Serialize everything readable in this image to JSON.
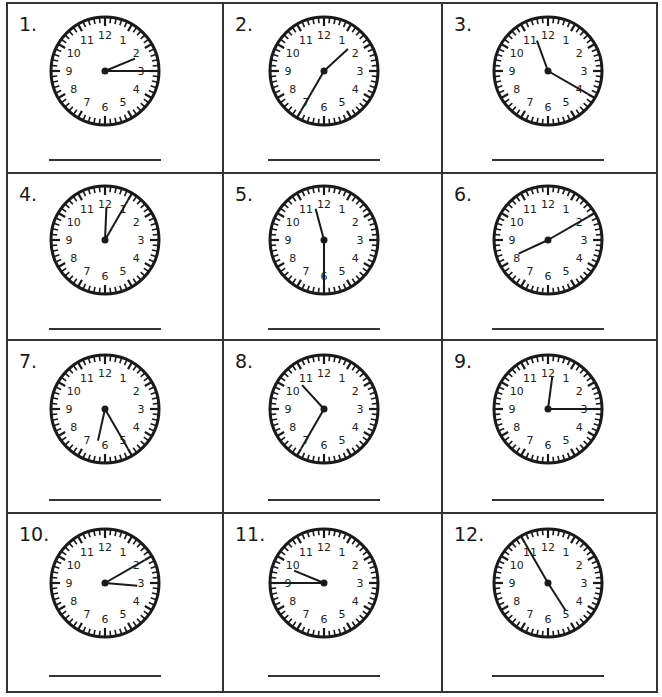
{
  "worksheet": {
    "title": "",
    "ink_color": "#1a1a1a",
    "grid_color": "#333333",
    "clock_numerals": [
      "12",
      "1",
      "2",
      "3",
      "4",
      "5",
      "6",
      "7",
      "8",
      "9",
      "10",
      "11"
    ],
    "problems": [
      {
        "label": "1.",
        "time": {
          "hour": 2,
          "minute": 15
        },
        "answer": ""
      },
      {
        "label": "2.",
        "time": {
          "hour": 1,
          "minute": 35
        },
        "answer": ""
      },
      {
        "label": "3.",
        "time": {
          "hour": 11,
          "minute": 20
        },
        "answer": ""
      },
      {
        "label": "4.",
        "time": {
          "hour": 12,
          "minute": 5
        },
        "answer": ""
      },
      {
        "label": "5.",
        "time": {
          "hour": 11,
          "minute": 30
        },
        "answer": ""
      },
      {
        "label": "6.",
        "time": {
          "hour": 8,
          "minute": 10
        },
        "answer": ""
      },
      {
        "label": "7.",
        "time": {
          "hour": 6,
          "minute": 25
        },
        "answer": ""
      },
      {
        "label": "8.",
        "time": {
          "hour": 10,
          "minute": 35
        },
        "answer": ""
      },
      {
        "label": "9.",
        "time": {
          "hour": 12,
          "minute": 15
        },
        "answer": ""
      },
      {
        "label": "10.",
        "time": {
          "hour": 3,
          "minute": 10
        },
        "answer": ""
      },
      {
        "label": "11.",
        "time": {
          "hour": 9,
          "minute": 45
        },
        "answer": ""
      },
      {
        "label": "12.",
        "time": {
          "hour": 4,
          "minute": 55
        },
        "answer": ""
      }
    ]
  }
}
